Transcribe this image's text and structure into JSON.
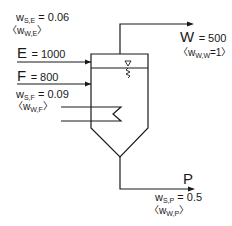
{
  "diagram": {
    "type": "evaporator/crystallizer process flow",
    "streams": {
      "E": {
        "name": "E",
        "value_text": "= 1000",
        "fraction_var": "w",
        "fraction_sub": "S,E",
        "fraction_text": "= 0.06",
        "alt_open": "〈w",
        "alt_sub": "W,E",
        "alt_close": "〉"
      },
      "F": {
        "name": "F",
        "value_text": "= 800",
        "fraction_var": "w",
        "fraction_sub": "S,F",
        "fraction_text": "= 0.09",
        "alt_open": "〈w",
        "alt_sub": "W,F",
        "alt_close": "〉"
      },
      "W": {
        "name": "W",
        "value_text": "= 500",
        "alt_open": "〈w",
        "alt_sub": "W,W",
        "alt_close": "=1〉"
      },
      "P": {
        "name": "P",
        "fraction_var": "w",
        "fraction_sub": "S,P",
        "fraction_text": "= 0.5",
        "alt_open": "〈w",
        "alt_sub": "W,P",
        "alt_close": "〉"
      }
    },
    "colors": {
      "line": "#1a1a1a",
      "background": "#ffffff"
    }
  }
}
